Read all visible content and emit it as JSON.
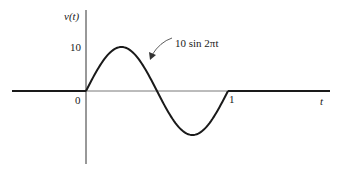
{
  "chart_data": {
    "type": "line",
    "title": "",
    "xlabel": "t",
    "ylabel": "v(t)",
    "annotation": "10 sin 2πt",
    "x_ticks": [
      {
        "value": 0,
        "label": "0"
      },
      {
        "value": 1,
        "label": "1"
      }
    ],
    "y_ticks": [
      {
        "value": 10,
        "label": "10"
      }
    ],
    "series": [
      {
        "name": "v(t)",
        "definition": "v(t) = 10 sin 2πt for 0 ≤ t ≤ 1, else 0",
        "x": [
          -0.6,
          0,
          0.125,
          0.25,
          0.375,
          0.5,
          0.625,
          0.75,
          0.875,
          1,
          1.7
        ],
        "values": [
          0,
          0,
          7.07,
          10,
          7.07,
          0,
          -7.07,
          -10,
          -7.07,
          0,
          0
        ]
      }
    ],
    "xlim": [
      -0.6,
      1.8
    ],
    "ylim": [
      -12,
      15
    ],
    "grid": false,
    "legend": "none",
    "color": "#1a1a1a"
  },
  "labels": {
    "y_axis": "v(t)",
    "x_axis": "t",
    "y_tick_10": "10",
    "x_tick_0": "0",
    "x_tick_1": "1",
    "curve_annotation": "10 sin 2πt"
  }
}
